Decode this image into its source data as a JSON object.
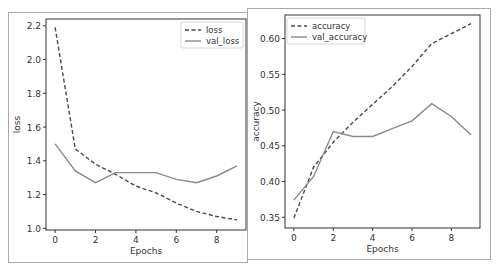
{
  "chart_data": [
    {
      "type": "line",
      "title": "",
      "xlabel": "Epochs",
      "ylabel": "loss",
      "x": [
        0,
        1,
        2,
        3,
        4,
        5,
        6,
        7,
        8,
        9
      ],
      "xticks": [
        "0",
        "2",
        "4",
        "6",
        "8"
      ],
      "yticks": [
        "1.0",
        "1.2",
        "1.4",
        "1.6",
        "1.8",
        "2.0",
        "2.2"
      ],
      "ylim": [
        0.99,
        2.24
      ],
      "xlim": [
        -0.45,
        9.45
      ],
      "legend_position": "upper right",
      "series": [
        {
          "name": "loss",
          "style": "dashed",
          "values": [
            2.19,
            1.47,
            1.38,
            1.32,
            1.25,
            1.21,
            1.15,
            1.1,
            1.07,
            1.05
          ]
        },
        {
          "name": "val_loss",
          "style": "solid",
          "values": [
            1.5,
            1.34,
            1.27,
            1.33,
            1.33,
            1.33,
            1.29,
            1.27,
            1.31,
            1.37
          ]
        }
      ]
    },
    {
      "type": "line",
      "title": "",
      "xlabel": "Epochs",
      "ylabel": "accuracy",
      "x": [
        0,
        1,
        2,
        3,
        4,
        5,
        6,
        7,
        8,
        9
      ],
      "xticks": [
        "0",
        "2",
        "4",
        "6",
        "8"
      ],
      "yticks": [
        "0.35",
        "0.40",
        "0.45",
        "0.50",
        "0.55",
        "0.60"
      ],
      "ylim": [
        0.335,
        0.633
      ],
      "xlim": [
        -0.45,
        9.45
      ],
      "legend_position": "upper left",
      "series": [
        {
          "name": "accuracy",
          "style": "dashed",
          "values": [
            0.349,
            0.42,
            0.455,
            0.483,
            0.508,
            0.533,
            0.561,
            0.593,
            0.607,
            0.621
          ]
        },
        {
          "name": "val_accuracy",
          "style": "solid",
          "values": [
            0.374,
            0.407,
            0.47,
            0.463,
            0.463,
            0.474,
            0.485,
            0.509,
            0.491,
            0.465
          ]
        }
      ]
    }
  ],
  "colors": {
    "line": "#555555",
    "axis": "#333333",
    "border": "#a9a9a9"
  }
}
